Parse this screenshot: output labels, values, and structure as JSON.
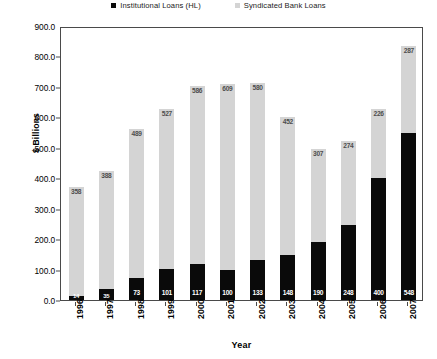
{
  "chart_data": {
    "type": "bar",
    "subtype": "stacked-bar",
    "title": "",
    "xlabel": "Year",
    "ylabel": "$ Billions",
    "categories": [
      "1996",
      "1997",
      "1998",
      "1999",
      "2000",
      "2001",
      "2002",
      "2003",
      "2004",
      "2005",
      "2006",
      "2007"
    ],
    "series": [
      {
        "name": "Institutional Loans (HL)",
        "color": "#0a0a0a",
        "values": [
          14,
          35,
          73,
          101,
          117,
          100,
          133,
          148,
          190,
          248,
          400,
          548
        ]
      },
      {
        "name": "Syndicated Bank Loans",
        "color": "#d4d4d4",
        "values": [
          358,
          388,
          489,
          527,
          586,
          609,
          580,
          452,
          307,
          274,
          226,
          287
        ]
      }
    ],
    "totals": [
      372,
      423,
      562,
      628,
      703,
      709,
      713,
      600,
      497,
      522,
      626,
      835
    ],
    "ylim": [
      0,
      900
    ],
    "yticks": [
      "0.0",
      "100.0",
      "200.0",
      "300.0",
      "400.0",
      "500.0",
      "600.0",
      "700.0",
      "800.0",
      "900.0"
    ],
    "ytick_values": [
      0,
      100,
      200,
      300,
      400,
      500,
      600,
      700,
      800,
      900
    ],
    "grid": false,
    "legend_position": "top-center"
  },
  "legend": {
    "entries": [
      {
        "label": "Institutional Loans (HL)",
        "color": "#0a0a0a"
      },
      {
        "label": "Syndicated Bank Loans",
        "color": "#d4d4d4"
      }
    ]
  },
  "axes": {
    "y_title": "$ Billions",
    "x_title": "Year"
  }
}
